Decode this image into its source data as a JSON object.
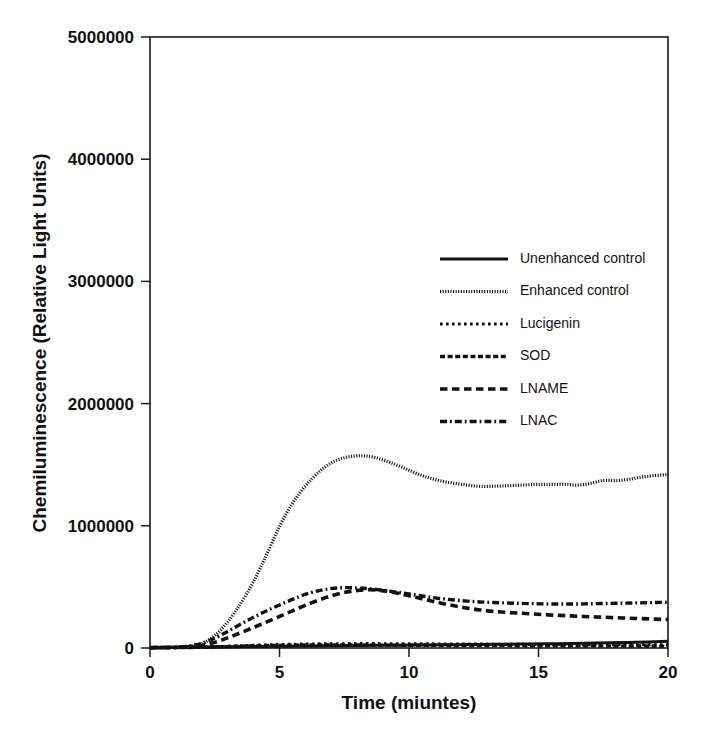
{
  "chart_data": {
    "type": "line",
    "title": "",
    "xlabel": "Time (miuntes)",
    "ylabel": "Chemiluminescence (Relative Light Units)",
    "xlim": [
      0,
      20
    ],
    "ylim": [
      0,
      5000000
    ],
    "xticks": [
      0,
      5,
      10,
      15,
      20
    ],
    "xtick_labels": [
      "0",
      "5",
      "10",
      "15",
      "20"
    ],
    "yticks": [
      0,
      1000000,
      2000000,
      3000000,
      4000000,
      5000000
    ],
    "ytick_labels": [
      "0",
      "1000000",
      "2000000",
      "3000000",
      "4000000",
      "5000000"
    ],
    "grid": false,
    "frame": true,
    "legend_position": "upper-right-inside",
    "x": [
      0,
      0.5,
      1,
      1.5,
      2,
      2.5,
      3,
      3.5,
      4,
      4.5,
      5,
      5.5,
      6,
      6.5,
      7,
      7.5,
      8,
      8.5,
      9,
      9.5,
      10,
      10.5,
      11,
      11.5,
      12,
      12.5,
      13,
      13.5,
      14,
      14.5,
      15,
      15.5,
      16,
      16.5,
      17,
      17.5,
      18,
      18.5,
      19,
      19.5,
      20
    ],
    "series": [
      {
        "name": "Unenhanced control",
        "style": "solid",
        "values": [
          5000,
          5000,
          6000,
          7000,
          8000,
          9000,
          10000,
          11000,
          12000,
          13000,
          14000,
          15000,
          16000,
          17000,
          18000,
          19000,
          20000,
          21000,
          22000,
          23000,
          24000,
          25000,
          26000,
          27000,
          28000,
          29000,
          30000,
          31000,
          32000,
          33000,
          34000,
          35000,
          36000,
          37000,
          39000,
          41000,
          43000,
          45000,
          48000,
          51000,
          55000
        ]
      },
      {
        "name": "Enhanced control",
        "style": "dotted-fine",
        "values": [
          4000,
          5000,
          7000,
          12000,
          30000,
          95000,
          210000,
          360000,
          540000,
          760000,
          1000000,
          1190000,
          1330000,
          1440000,
          1520000,
          1560000,
          1575000,
          1570000,
          1540000,
          1500000,
          1455000,
          1410000,
          1378000,
          1355000,
          1340000,
          1325000,
          1322000,
          1325000,
          1330000,
          1335000,
          1340000,
          1338000,
          1342000,
          1330000,
          1345000,
          1375000,
          1368000,
          1380000,
          1400000,
          1412000,
          1420000
        ]
      },
      {
        "name": "Lucigenin",
        "style": "dotted-square",
        "values": [
          3000,
          3000,
          4000,
          5000,
          7000,
          10000,
          14000,
          18000,
          22000,
          25000,
          28000,
          30000,
          32000,
          33000,
          34000,
          35000,
          35000,
          35000,
          35000,
          34000,
          34000,
          33000,
          33000,
          32000,
          32000,
          31000,
          31000,
          30000,
          30000,
          30000,
          29000,
          29000,
          29000,
          28000,
          28000,
          28000,
          27000,
          27000,
          27000,
          26000,
          26000
        ]
      },
      {
        "name": "SOD",
        "style": "dash-dense",
        "values": [
          2000,
          2000,
          3000,
          4000,
          6000,
          9000,
          12000,
          15000,
          18000,
          20000,
          22000,
          23000,
          24000,
          25000,
          25000,
          25000,
          25000,
          24000,
          24000,
          23000,
          23000,
          22000,
          22000,
          21000,
          21000,
          20000,
          20000,
          20000,
          19000,
          19000,
          19000,
          18000,
          18000,
          18000,
          17000,
          17000,
          17000,
          16000,
          16000,
          16000,
          15000
        ]
      },
      {
        "name": "LNAME",
        "style": "dash-medium",
        "values": [
          3000,
          3000,
          4000,
          8000,
          18000,
          45000,
          82000,
          125000,
          168000,
          212000,
          258000,
          305000,
          350000,
          392000,
          428000,
          455000,
          472000,
          478000,
          470000,
          452000,
          428000,
          402000,
          378000,
          355000,
          335000,
          318000,
          305000,
          295000,
          288000,
          282000,
          276000,
          270000,
          265000,
          260000,
          256000,
          252000,
          248000,
          244000,
          240000,
          236000,
          232000
        ]
      },
      {
        "name": "LNAC",
        "style": "dash-dot",
        "values": [
          3000,
          4000,
          6000,
          14000,
          35000,
          80000,
          135000,
          195000,
          252000,
          305000,
          352000,
          398000,
          440000,
          470000,
          488000,
          495000,
          492000,
          485000,
          472000,
          458000,
          442000,
          425000,
          410000,
          398000,
          388000,
          380000,
          374000,
          370000,
          367000,
          364000,
          362000,
          360000,
          360000,
          360000,
          362000,
          364000,
          366000,
          368000,
          370000,
          372000,
          374000
        ]
      }
    ]
  },
  "legend": {
    "items": [
      {
        "label": "Unenhanced control"
      },
      {
        "label": "Enhanced control"
      },
      {
        "label": "Lucigenin"
      },
      {
        "label": "SOD"
      },
      {
        "label": "LNAME"
      },
      {
        "label": "LNAC"
      }
    ]
  },
  "colors": {
    "ink": "#111111",
    "background": "#ffffff"
  }
}
